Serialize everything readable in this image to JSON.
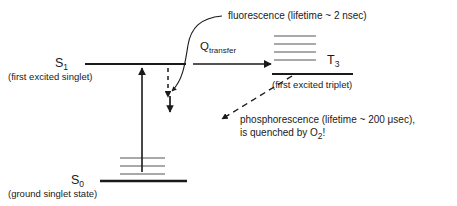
{
  "diagram": {
    "background_color": "#ffffff",
    "line_color": "#1a1a1a",
    "vib_line_color": "#8c8c8c",
    "text_color": "#1a1a1a"
  },
  "states": {
    "s1": {
      "symbol": "S",
      "subscript": "1",
      "caption": "(first excited singlet)"
    },
    "s0": {
      "symbol": "S",
      "subscript": "0",
      "caption": "(ground singlet state)"
    },
    "t3": {
      "symbol": "T",
      "subscript": "3",
      "caption": "(first excited triplet)"
    }
  },
  "transitions": {
    "transfer": {
      "symbol": "Q",
      "subscript": "transfer"
    },
    "fluorescence": {
      "label": "fluorescence (lifetime ~ 2 nsec)"
    },
    "phosphorescence": {
      "line1": "phosphorescence (lifetime ~ 200 ",
      "line1_mu": "μ",
      "line1_end": "sec),",
      "line2_a": "is quenched by O",
      "line2_sub": "2",
      "line2_b": "!"
    }
  },
  "vibrational_levels": {
    "s0_count": 3,
    "t3_count": 4
  }
}
